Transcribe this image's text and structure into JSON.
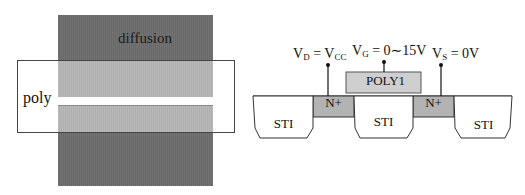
{
  "layout_view": {
    "diffusion_label": "diffusion",
    "poly_label": "poly",
    "colors": {
      "diffusion": "#6d6d6d",
      "overlap": "#b5b5b5",
      "poly_outline": "#444444"
    }
  },
  "cross_section": {
    "terminals": [
      {
        "name": "drain",
        "symbol": "V",
        "sub": "D",
        "eq": " = V",
        "eq_sub": "CC",
        "value": ""
      },
      {
        "name": "gate",
        "symbol": "V",
        "sub": "G",
        "eq": " = 0∼15V",
        "eq_sub": "",
        "value": ""
      },
      {
        "name": "source",
        "symbol": "V",
        "sub": "S",
        "eq": " = 0V",
        "eq_sub": "",
        "value": ""
      }
    ],
    "gate_label": "POLY1",
    "diffusion_labels": [
      "N+",
      "N+"
    ],
    "sti_labels": [
      "STI",
      "STI",
      "STI"
    ],
    "colors": {
      "n_plus": "#b3b3b3",
      "poly1": "#cfcfcf",
      "sti": "#ffffff",
      "line": "#333333"
    }
  }
}
